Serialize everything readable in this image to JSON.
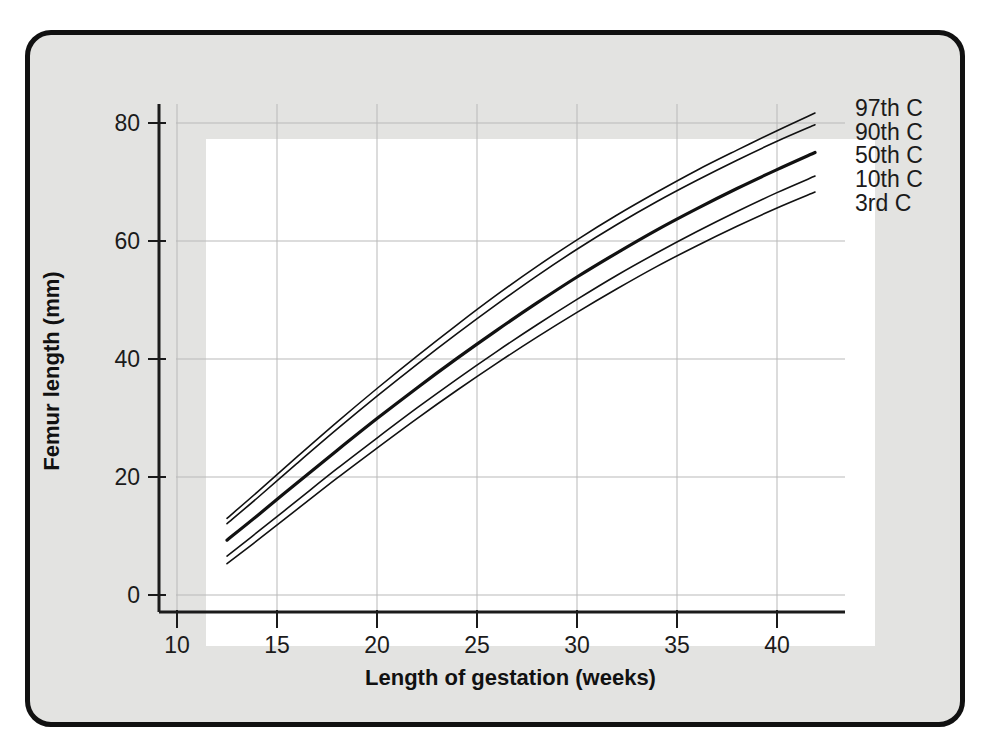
{
  "figure": {
    "background_color": "#e3e3e1",
    "frame_color": "#111111",
    "plot_background": "#ffffff",
    "curve_color": "#111111",
    "grid_color": "#b9b9b9"
  },
  "chart_data": {
    "type": "line",
    "title": "",
    "xlabel": "Length of gestation (weeks)",
    "ylabel": "Femur length (mm)",
    "xlim": [
      8.8,
      42.6
    ],
    "ylim": [
      -2,
      86
    ],
    "xticks": [
      10,
      15,
      20,
      25,
      30,
      35,
      40
    ],
    "xtick_labels": [
      "10",
      "15",
      "20",
      "25",
      "30",
      "35",
      "40"
    ],
    "yticks": [
      0,
      20,
      40,
      60,
      80
    ],
    "ytick_labels": [
      "0",
      "20",
      "40",
      "60",
      "80"
    ],
    "grid": true,
    "grid_axis": "both",
    "legend_position": "right-of-axes-inline",
    "x": [
      12.5,
      14,
      16,
      18,
      20,
      22,
      24,
      26,
      28,
      30,
      32,
      34,
      36,
      38,
      40,
      41.9
    ],
    "series": [
      {
        "name": "97th C",
        "label": "97th C",
        "line_width": 1.6,
        "values": [
          13.0,
          17.4,
          23.4,
          29.3,
          35.0,
          40.5,
          45.8,
          50.9,
          55.7,
          60.2,
          64.4,
          68.3,
          72.0,
          75.4,
          78.7,
          81.7
        ],
        "label_y": 82.5
      },
      {
        "name": "90th C",
        "label": "90th C",
        "line_width": 1.6,
        "values": [
          12.1,
          16.4,
          22.3,
          28.1,
          33.7,
          39.1,
          44.3,
          49.3,
          54.1,
          58.6,
          62.8,
          66.7,
          70.3,
          73.7,
          76.9,
          79.7
        ],
        "label_y": 78.5
      },
      {
        "name": "50th C",
        "label": "50th C",
        "line_width": 3.2,
        "values": [
          9.3,
          13.4,
          19.0,
          24.5,
          29.9,
          35.1,
          40.1,
          44.9,
          49.5,
          53.9,
          58.0,
          61.9,
          65.5,
          68.9,
          72.1,
          75.0
        ],
        "label_y": 74.5
      },
      {
        "name": "10th C",
        "label": "10th C",
        "line_width": 1.6,
        "values": [
          6.6,
          10.6,
          16.0,
          21.4,
          26.6,
          31.7,
          36.6,
          41.3,
          45.8,
          50.1,
          54.2,
          58.0,
          61.6,
          65.0,
          68.2,
          71.0
        ],
        "label_y": 70.5
      },
      {
        "name": "3rd C",
        "label": "3rd C",
        "line_width": 1.6,
        "values": [
          5.3,
          9.2,
          14.5,
          19.8,
          24.9,
          29.9,
          34.7,
          39.3,
          43.7,
          47.9,
          51.9,
          55.7,
          59.2,
          62.5,
          65.6,
          68.3
        ],
        "label_y": 66.5
      }
    ]
  }
}
